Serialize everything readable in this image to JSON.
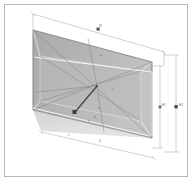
{
  "document": {
    "title": "Perspective Box Dimension Drawing",
    "page_background": "#ffffff",
    "frame_border_color": "#b9b9b9"
  },
  "drawing": {
    "type": "technical-perspective-projection",
    "description": "Rectangular box shown in two-point perspective with overall dimension lines, diagonal construction lines converging at a center point, and a directional vector arrow.",
    "palette": {
      "face_fill_back": "#b4b4b4",
      "face_fill_floor": "#d2d2d2",
      "face_fill_side": "#c6c6c6",
      "edge_line": "#8a8a8a",
      "highlight_line": "#ffffff",
      "dimension_line": "#9a9a9a",
      "construction_line": "#a0a0a0",
      "vector_arrow": "#4a4a4a",
      "marker_fill": "#3c3c3c"
    },
    "geometry": {
      "back_face": {
        "top_left": [
          33,
          30
        ],
        "top_right": [
          152,
          62
        ],
        "bottom_right": [
          152,
          138
        ],
        "bottom_left": [
          33,
          110
        ]
      },
      "front_opening": {
        "top_left": [
          33,
          30
        ],
        "top_right": [
          152,
          62
        ],
        "bottom_right": [
          152,
          138
        ],
        "bottom_left": [
          33,
          110
        ]
      },
      "inner_rear_rect": {
        "top_left": [
          40,
          55
        ],
        "top_right": [
          140,
          70
        ],
        "bottom_right": [
          140,
          120
        ],
        "bottom_left": [
          40,
          100
        ]
      },
      "convergence_point": [
        97,
        86
      ],
      "vector_arrow": {
        "from": [
          97,
          86
        ],
        "to": [
          74,
          113
        ]
      },
      "vector_marker": [
        74,
        113
      ]
    },
    "dimension_lines": [
      {
        "name": "overall-width",
        "orientation": "top",
        "from": [
          33,
          14
        ],
        "to": [
          164,
          52
        ],
        "label": "W",
        "label_pos": [
          98,
          30
        ]
      },
      {
        "name": "depth",
        "orientation": "bottom",
        "from": [
          41,
          131
        ],
        "to": [
          152,
          158
        ],
        "label": "D",
        "label_pos": [
          98,
          140
        ]
      },
      {
        "name": "height-inner",
        "orientation": "right",
        "from": [
          160,
          66
        ],
        "to": [
          160,
          148
        ],
        "label": "H1",
        "label_pos": [
          160,
          107
        ]
      },
      {
        "name": "height-outer",
        "orientation": "right",
        "from": [
          176,
          55
        ],
        "to": [
          176,
          152
        ],
        "label": "H2",
        "label_pos": [
          176,
          107
        ]
      }
    ],
    "annotations": [
      {
        "name": "annotation-top-face",
        "text": "a",
        "pos": [
          100,
          55
        ]
      },
      {
        "name": "annotation-center",
        "text": "r",
        "pos": [
          112,
          90
        ]
      },
      {
        "name": "annotation-lower-left",
        "text": "b",
        "pos": [
          98,
          108
        ]
      },
      {
        "name": "annotation-lower-mid",
        "text": "h",
        "pos": [
          94,
          117
        ]
      },
      {
        "name": "annotation-floor-left",
        "text": "c",
        "pos": [
          68,
          135
        ]
      },
      {
        "name": "annotation-vector",
        "text": "v",
        "pos": [
          88,
          120
        ]
      }
    ],
    "markers": {
      "width_tick": [
        98,
        30
      ],
      "height_tick_inner": [
        160,
        107
      ],
      "height_tick_outer": [
        176,
        107
      ],
      "vector_end": [
        74,
        113
      ]
    }
  }
}
